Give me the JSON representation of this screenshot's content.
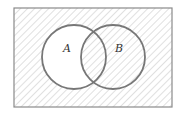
{
  "diagram": {
    "type": "venn",
    "universe": {
      "x": 14,
      "y": 8,
      "width": 158,
      "height": 99
    },
    "sets": [
      {
        "label": "A",
        "cx": 74,
        "cy": 57,
        "r": 32
      },
      {
        "label": "B",
        "cx": 113,
        "cy": 57,
        "r": 32
      }
    ],
    "shaded_region": "complement of A, union B (everything except A-only)",
    "colors": {
      "stroke_circle": "#777777",
      "stroke_rect": "#888888",
      "hatch": "#cfcfcf",
      "background": "#ffffff"
    }
  }
}
